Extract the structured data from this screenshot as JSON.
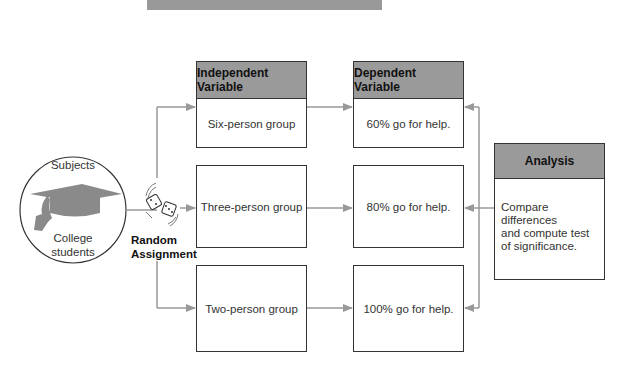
{
  "subjects": {
    "title": "Subjects",
    "group": "College students",
    "group_line1": "College",
    "group_line2": "students",
    "icon": "graduation-cap-icon"
  },
  "random_assignment": {
    "line1": "Random",
    "line2": "Assignment",
    "icon": "dice-icon"
  },
  "independent_variable": {
    "header": "Independent Variable",
    "conditions": [
      "Six-person group",
      "Three-person group",
      "Two-person group"
    ]
  },
  "dependent_variable": {
    "header": "Dependent Variable",
    "results": [
      "60% go for help.",
      "80% go for help.",
      "100% go for help."
    ]
  },
  "analysis": {
    "header": "Analysis",
    "line1": "Compare differences",
    "line2": "and compute test",
    "line3": "of significance."
  },
  "colors": {
    "header_fill": "#9a9a9a",
    "arrow": "#999999",
    "border": "#333333"
  }
}
